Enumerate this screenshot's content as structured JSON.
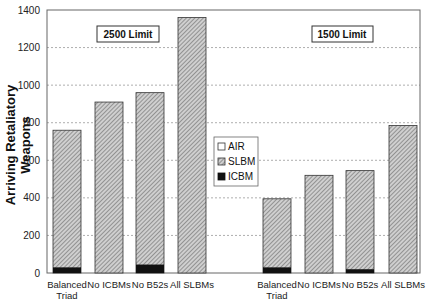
{
  "chart_data": {
    "type": "bar",
    "stacked": true,
    "title": "",
    "xlabel": "",
    "ylabel": "Arriving Retaliatory Weapons",
    "ylim": [
      0,
      1400
    ],
    "yticks": [
      0,
      200,
      400,
      600,
      800,
      1000,
      1200,
      1400
    ],
    "grid": "horizontal dashed",
    "legend": {
      "position": "center",
      "entries": [
        "AIR",
        "SLBM",
        "ICBM"
      ]
    },
    "groups": [
      {
        "label": "2500 Limit",
        "categories": [
          "Balanced Triad",
          "No ICBMs",
          "No B52s",
          "All SLBMs"
        ],
        "series": [
          {
            "name": "ICBM",
            "values": [
              30,
              0,
              45,
              0
            ]
          },
          {
            "name": "SLBM",
            "values": [
              730,
              910,
              915,
              1360
            ]
          },
          {
            "name": "AIR",
            "values": [
              0,
              0,
              0,
              0
            ]
          }
        ],
        "totals": [
          760,
          910,
          960,
          1360
        ]
      },
      {
        "label": "1500 Limit",
        "categories": [
          "Balanced Triad",
          "No ICBMs",
          "No B52s",
          "All SLBMs"
        ],
        "series": [
          {
            "name": "ICBM",
            "values": [
              30,
              0,
              20,
              0
            ]
          },
          {
            "name": "SLBM",
            "values": [
              365,
              520,
              525,
              785
            ]
          },
          {
            "name": "AIR",
            "values": [
              0,
              0,
              0,
              0
            ]
          }
        ],
        "totals": [
          395,
          520,
          545,
          785
        ]
      }
    ]
  },
  "ylabel": "Arriving Retaliatory Weapons",
  "labels": {
    "group1": "2500 Limit",
    "group2": "1500 Limit",
    "legend_air": "AIR",
    "legend_slbm": "SLBM",
    "legend_icbm": "ICBM"
  }
}
